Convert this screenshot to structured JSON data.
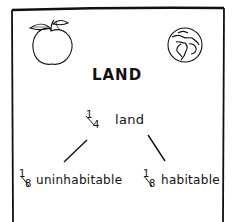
{
  "diagram": {
    "title": "LAND",
    "icons": {
      "left": "apple-icon",
      "right": "globe-icon"
    },
    "root": {
      "fraction_num": "1",
      "fraction_den": "4",
      "label": "land"
    },
    "children": [
      {
        "fraction_num": "1",
        "fraction_den": "8",
        "label": "uninhabitable"
      },
      {
        "fraction_num": "1",
        "fraction_den": "8",
        "label": "habitable"
      }
    ]
  }
}
